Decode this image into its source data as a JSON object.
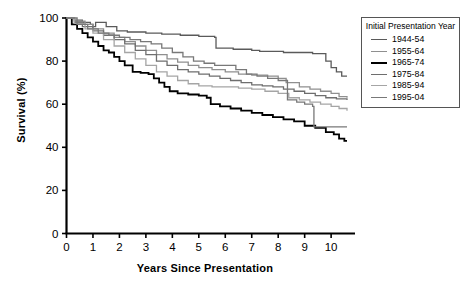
{
  "chart_data": {
    "type": "line",
    "title": "",
    "xlabel": "Years Since Presentation",
    "ylabel": "Survival (%)",
    "xlim": [
      0,
      10.6
    ],
    "ylim": [
      0,
      100
    ],
    "xticks": [
      "0",
      "1",
      "2",
      "3",
      "4",
      "5",
      "6",
      "7",
      "8",
      "9",
      "10"
    ],
    "yticks": [
      "0",
      "20",
      "40",
      "60",
      "80",
      "100"
    ],
    "grid": false,
    "legend_position": "right",
    "legend_title": "Initial Presentation Year",
    "series": [
      {
        "name": "1944-54",
        "color": "#5a5a5a",
        "width": 1.3,
        "final_value": 73,
        "points": [
          [
            0,
            100
          ],
          [
            0.3,
            99
          ],
          [
            0.6,
            98
          ],
          [
            0.9,
            97
          ],
          [
            1.0,
            96
          ],
          [
            1.1,
            98
          ],
          [
            1.5,
            96
          ],
          [
            1.9,
            94
          ],
          [
            2.3,
            93.5
          ],
          [
            3.0,
            93
          ],
          [
            3.6,
            92.5
          ],
          [
            4.3,
            92
          ],
          [
            5.0,
            91.5
          ],
          [
            5.6,
            91
          ],
          [
            5.65,
            86
          ],
          [
            6.3,
            85.5
          ],
          [
            7.0,
            85
          ],
          [
            7.3,
            84.5
          ],
          [
            8.2,
            84
          ],
          [
            9.3,
            83.5
          ],
          [
            9.8,
            80
          ],
          [
            10.0,
            77
          ],
          [
            10.2,
            75
          ],
          [
            10.4,
            73
          ],
          [
            10.6,
            73
          ]
        ]
      },
      {
        "name": "1955-64",
        "color": "#8f8f8f",
        "width": 1.3,
        "final_value": 63,
        "points": [
          [
            0,
            100
          ],
          [
            0.3,
            98.5
          ],
          [
            0.7,
            97
          ],
          [
            1.0,
            95
          ],
          [
            1.4,
            93
          ],
          [
            1.8,
            91
          ],
          [
            2.2,
            89
          ],
          [
            2.6,
            87
          ],
          [
            3.0,
            85
          ],
          [
            3.4,
            83
          ],
          [
            3.8,
            81
          ],
          [
            4.2,
            79.5
          ],
          [
            4.6,
            78
          ],
          [
            5.0,
            77
          ],
          [
            5.5,
            76
          ],
          [
            6.0,
            75
          ],
          [
            6.5,
            74
          ],
          [
            7.0,
            73.5
          ],
          [
            7.6,
            73
          ],
          [
            8.0,
            72
          ],
          [
            8.3,
            70
          ],
          [
            8.8,
            68
          ],
          [
            9.2,
            67
          ],
          [
            9.6,
            66
          ],
          [
            10.0,
            65
          ],
          [
            10.3,
            63.5
          ],
          [
            10.6,
            63
          ]
        ]
      },
      {
        "name": "1965-74",
        "color": "#000000",
        "width": 1.8,
        "final_value": 43,
        "points": [
          [
            0,
            100
          ],
          [
            0.2,
            97
          ],
          [
            0.4,
            95
          ],
          [
            0.6,
            93
          ],
          [
            0.8,
            91
          ],
          [
            1.0,
            89
          ],
          [
            1.2,
            87
          ],
          [
            1.4,
            85
          ],
          [
            1.6,
            84
          ],
          [
            1.8,
            82
          ],
          [
            2.0,
            80
          ],
          [
            2.2,
            78
          ],
          [
            2.5,
            75
          ],
          [
            2.8,
            74.5
          ],
          [
            3.1,
            74
          ],
          [
            3.3,
            72
          ],
          [
            3.5,
            70
          ],
          [
            3.7,
            68
          ],
          [
            3.9,
            66
          ],
          [
            4.2,
            65
          ],
          [
            4.6,
            64.5
          ],
          [
            5.0,
            64
          ],
          [
            5.3,
            63
          ],
          [
            5.45,
            60
          ],
          [
            5.8,
            59
          ],
          [
            6.2,
            58
          ],
          [
            6.6,
            57
          ],
          [
            7.0,
            56
          ],
          [
            7.4,
            55
          ],
          [
            7.8,
            54
          ],
          [
            8.2,
            53
          ],
          [
            8.6,
            52
          ],
          [
            9.0,
            50
          ],
          [
            9.4,
            49
          ],
          [
            9.8,
            47
          ],
          [
            10.1,
            46
          ],
          [
            10.3,
            44
          ],
          [
            10.5,
            43
          ],
          [
            10.6,
            43
          ]
        ]
      },
      {
        "name": "1975-84",
        "color": "#6e6e6e",
        "width": 1.3,
        "final_value": 62,
        "points": [
          [
            0,
            100
          ],
          [
            0.3,
            98
          ],
          [
            0.6,
            96
          ],
          [
            1.0,
            94
          ],
          [
            1.4,
            92
          ],
          [
            1.8,
            90
          ],
          [
            2.2,
            88
          ],
          [
            2.6,
            85
          ],
          [
            3.0,
            83
          ],
          [
            3.4,
            80
          ],
          [
            3.8,
            78
          ],
          [
            4.2,
            76
          ],
          [
            4.6,
            75
          ],
          [
            5.0,
            74
          ],
          [
            5.4,
            73
          ],
          [
            5.8,
            72
          ],
          [
            6.2,
            71
          ],
          [
            6.6,
            70
          ],
          [
            7.0,
            69
          ],
          [
            7.4,
            68.5
          ],
          [
            7.8,
            68
          ],
          [
            8.2,
            67
          ],
          [
            8.6,
            66
          ],
          [
            9.0,
            65
          ],
          [
            9.4,
            64
          ],
          [
            9.8,
            63
          ],
          [
            10.2,
            62.5
          ],
          [
            10.6,
            62
          ]
        ]
      },
      {
        "name": "1985-94",
        "color": "#a5a5a5",
        "width": 1.3,
        "final_value": 57,
        "points": [
          [
            0,
            100
          ],
          [
            0.3,
            97.5
          ],
          [
            0.7,
            95
          ],
          [
            1.0,
            93
          ],
          [
            1.4,
            90
          ],
          [
            1.8,
            87
          ],
          [
            2.2,
            84
          ],
          [
            2.6,
            81
          ],
          [
            3.0,
            78
          ],
          [
            3.4,
            75
          ],
          [
            3.8,
            73
          ],
          [
            4.2,
            71
          ],
          [
            4.6,
            69.5
          ],
          [
            5.0,
            68.5
          ],
          [
            5.5,
            68
          ],
          [
            6.0,
            68
          ],
          [
            6.5,
            67.5
          ],
          [
            7.0,
            67
          ],
          [
            7.5,
            66
          ],
          [
            8.0,
            65
          ],
          [
            8.4,
            63
          ],
          [
            8.8,
            62
          ],
          [
            9.2,
            61
          ],
          [
            9.6,
            60
          ],
          [
            10.0,
            59
          ],
          [
            10.3,
            58
          ],
          [
            10.6,
            57
          ]
        ]
      },
      {
        "name": "1995-04",
        "color": "#787878",
        "width": 1.3,
        "final_value": 49,
        "points": [
          [
            0,
            100
          ],
          [
            0.4,
            97
          ],
          [
            0.8,
            95
          ],
          [
            1.2,
            93
          ],
          [
            1.6,
            92
          ],
          [
            2.0,
            91
          ],
          [
            2.4,
            90
          ],
          [
            2.8,
            89
          ],
          [
            3.2,
            88
          ],
          [
            3.6,
            86
          ],
          [
            4.0,
            84
          ],
          [
            4.4,
            82
          ],
          [
            4.8,
            80
          ],
          [
            5.2,
            79
          ],
          [
            5.6,
            78
          ],
          [
            6.0,
            78
          ],
          [
            6.4,
            76
          ],
          [
            6.8,
            74
          ],
          [
            7.2,
            73
          ],
          [
            7.6,
            72
          ],
          [
            8.0,
            71
          ],
          [
            8.3,
            71
          ],
          [
            8.35,
            62
          ],
          [
            8.7,
            61
          ],
          [
            9.0,
            60
          ],
          [
            9.3,
            59
          ],
          [
            9.35,
            49.5
          ],
          [
            9.8,
            49.5
          ],
          [
            10.3,
            49.5
          ],
          [
            10.6,
            49.5
          ]
        ]
      }
    ]
  }
}
